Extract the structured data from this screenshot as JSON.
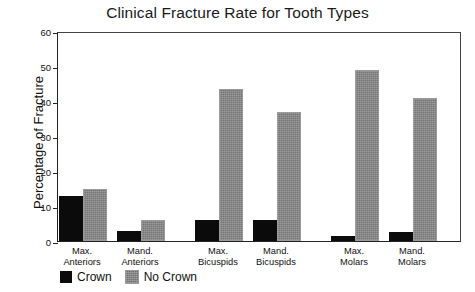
{
  "chart_data": {
    "type": "bar",
    "title": "Clinical Fracture Rate for Tooth Types",
    "xlabel": "",
    "ylabel": "Percentage of Fracture",
    "ylim": [
      0,
      60
    ],
    "yticks": [
      0,
      10,
      20,
      30,
      40,
      50,
      60
    ],
    "grid": false,
    "legend_position": "below-axis-left",
    "categories": [
      "Max.\nAnteriors",
      "Mand.\nAnteriors",
      "Max.\nBicuspids",
      "Mand.\nBicuspids",
      "Max.\nMolars",
      "Mand.\nMolars"
    ],
    "series": [
      {
        "name": "Crown",
        "color": "#0b0b0b",
        "values": [
          13,
          3,
          6,
          6,
          1.5,
          2.5
        ]
      },
      {
        "name": "No Crown",
        "color": "#848484",
        "values": [
          15,
          6,
          43.5,
          37,
          49,
          41
        ]
      }
    ]
  },
  "legend": {
    "items": [
      {
        "label": "Crown",
        "swatch": "crown-swatch"
      },
      {
        "label": "No Crown",
        "swatch": "no-crown-swatch"
      }
    ]
  }
}
